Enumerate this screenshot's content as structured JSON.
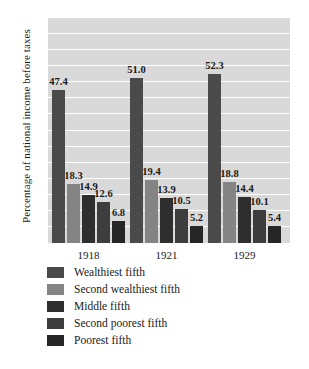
{
  "chart_data": {
    "type": "bar",
    "title": "",
    "xlabel": "",
    "ylabel": "Percentage of national income before taxes",
    "categories": [
      "1918",
      "1921",
      "1929"
    ],
    "ylim": [
      0,
      70
    ],
    "ytick_step": 5,
    "yticks": [
      "70",
      "65",
      "60",
      "55",
      "50",
      "45",
      "40",
      "35",
      "30",
      "25",
      "20",
      "15",
      "10",
      "5",
      "0"
    ],
    "grid": true,
    "legend_position": "below",
    "series": [
      {
        "name": "Wealthiest fifth",
        "color": "#4a4a4a",
        "values": [
          47.4,
          51.0,
          52.3
        ],
        "labels": [
          "47.4",
          "51.0",
          "52.3"
        ]
      },
      {
        "name": "Second wealthiest fifth",
        "color": "#848484",
        "values": [
          18.3,
          19.4,
          18.8
        ],
        "labels": [
          "18.3",
          "19.4",
          "18.8"
        ]
      },
      {
        "name": "Middle fifth",
        "color": "#2e2e2e",
        "values": [
          14.9,
          13.9,
          14.4
        ],
        "labels": [
          "14.9",
          "13.9",
          "14.4"
        ]
      },
      {
        "name": "Second poorest fifth",
        "color": "#3d3d3d",
        "values": [
          12.6,
          10.5,
          10.1
        ],
        "labels": [
          "12.6",
          "10.5",
          "10.1"
        ]
      },
      {
        "name": "Poorest fifth",
        "color": "#262626",
        "values": [
          6.8,
          5.2,
          5.4
        ],
        "labels": [
          "6.8",
          "5.2",
          "5.4"
        ]
      }
    ],
    "plot_background": "#d9d9d9",
    "gridline_color": "#ffffff"
  }
}
